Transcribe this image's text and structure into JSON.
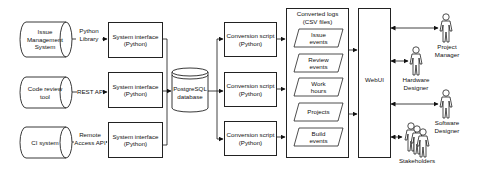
{
  "sources": [
    {
      "label": "Issue Management System",
      "lines": [
        "Issue",
        "Management",
        "System"
      ],
      "connector": [
        "Python",
        "Library"
      ]
    },
    {
      "label": "Code review tool",
      "lines": [
        "Code review",
        "tool"
      ],
      "connector": [
        "REST API"
      ]
    },
    {
      "label": "CI system",
      "lines": [
        "CI system"
      ],
      "connector": [
        "Remote",
        "Access API"
      ]
    }
  ],
  "system_interfaces": [
    {
      "line1": "System interface",
      "line2": "(Python)"
    },
    {
      "line1": "System interface",
      "line2": "(Python)"
    },
    {
      "line1": "System interface",
      "line2": "(Python)"
    }
  ],
  "database": {
    "line1": "PostgreSQL",
    "line2": "database"
  },
  "conversion_scripts": [
    {
      "line1": "Conversion script",
      "line2": "(Python)"
    },
    {
      "line1": "Conversion script",
      "line2": "(Python)"
    },
    {
      "line1": "Conversion script",
      "line2": "(Python)"
    }
  ],
  "converted_logs": {
    "title1": "Converted logs",
    "title2": "(CSV files)",
    "files": [
      {
        "line1": "Issue",
        "line2": "events"
      },
      {
        "line1": "Review",
        "line2": "events"
      },
      {
        "line1": "Work",
        "line2": "hours"
      },
      {
        "line1": "Projects",
        "line2": ""
      },
      {
        "line1": "Build",
        "line2": "events"
      }
    ]
  },
  "webui": {
    "label": "WebUI"
  },
  "actors": [
    {
      "line1": "Project",
      "line2": "Manager"
    },
    {
      "line1": "Hardware",
      "line2": "Designer"
    },
    {
      "line1": "Software",
      "line2": "Designer"
    },
    {
      "line1": "Stakeholders",
      "line2": ""
    }
  ]
}
